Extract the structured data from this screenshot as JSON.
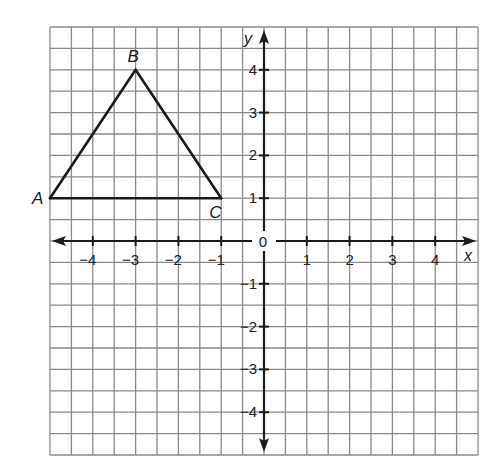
{
  "figure": {
    "type": "coordinate-plane",
    "x_axis": {
      "name": "x",
      "range": [
        -5,
        5
      ],
      "tick_labels": [
        "-4",
        "-3",
        "-2",
        "-1",
        "1",
        "2",
        "3",
        "4"
      ],
      "tick_values": [
        -4,
        -3,
        -2,
        -1,
        1,
        2,
        3,
        4
      ]
    },
    "y_axis": {
      "name": "y",
      "range": [
        -5,
        5
      ],
      "tick_labels": [
        "-4",
        "-3",
        "-2",
        "-1",
        "1",
        "2",
        "3",
        "4"
      ],
      "tick_values": [
        -4,
        -3,
        -2,
        -1,
        1,
        2,
        3,
        4
      ]
    },
    "origin_label": "0",
    "grid_cells_per_unit": 2,
    "triangle": {
      "vertices": [
        {
          "label": "A",
          "x": -5,
          "y": 1
        },
        {
          "label": "B",
          "x": -3,
          "y": 4
        },
        {
          "label": "C",
          "x": -1,
          "y": 1
        }
      ],
      "sides": [
        [
          "A",
          "B"
        ],
        [
          "B",
          "C"
        ],
        [
          "C",
          "A"
        ]
      ]
    }
  },
  "colors": {
    "grid": "#8a8a8a",
    "axis": "#1a1a1a",
    "figure": "#1a1a1a"
  }
}
